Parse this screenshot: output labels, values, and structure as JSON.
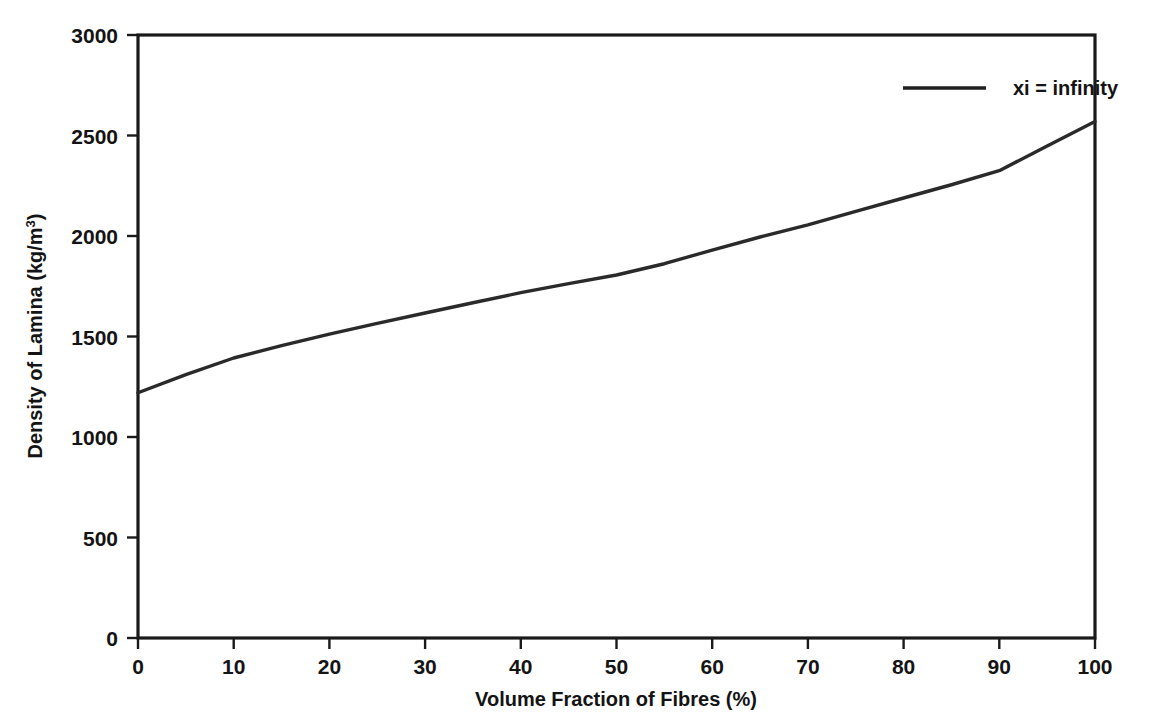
{
  "chart_data": {
    "type": "line",
    "title": "",
    "subtitle": "",
    "xlabel": "Volume Fraction of Fibres (%)",
    "ylabel": "Density of Lamina (kg/m³)",
    "ylabel_base": "Density of Lamina (kg/m",
    "ylabel_exponent": "3",
    "ylabel_close": ")",
    "xlim": [
      0,
      100
    ],
    "ylim": [
      0,
      3000
    ],
    "xticks": [
      0,
      10,
      20,
      30,
      40,
      50,
      60,
      70,
      80,
      90,
      100
    ],
    "yticks": [
      0,
      500,
      1000,
      1500,
      2000,
      2500,
      3000
    ],
    "xtick_labels": [
      "0",
      "10",
      "20",
      "30",
      "40",
      "50",
      "60",
      "70",
      "80",
      "90",
      "100"
    ],
    "ytick_labels": [
      "0",
      "500",
      "1000",
      "1500",
      "2000",
      "2500",
      "3000"
    ],
    "grid": false,
    "legend_position": "top-right",
    "line_color": "#2a2a2a",
    "axis_color": "#1a1a1a",
    "background_color": "#ffffff",
    "series": [
      {
        "name": "xi = infinity",
        "x": [
          0,
          5,
          10,
          15,
          20,
          25,
          30,
          35,
          40,
          45,
          50,
          55,
          60,
          65,
          70,
          75,
          80,
          85,
          90,
          95,
          100
        ],
        "values": [
          1220,
          1310,
          1393,
          1455,
          1512,
          1565,
          1617,
          1668,
          1718,
          1763,
          1806,
          1862,
          1930,
          1995,
          2055,
          2122,
          2189,
          2255,
          2325,
          2448,
          2570
        ]
      }
    ]
  },
  "legend": {
    "entries": [
      {
        "label": "xi = infinity",
        "color": "#1f1f1f"
      }
    ]
  },
  "axes": {
    "x_axis_name": "Volume Fraction of Fibres (%)",
    "y_axis_name": "Density of Lamina (kg/m³)"
  }
}
